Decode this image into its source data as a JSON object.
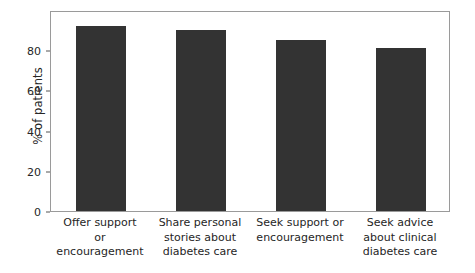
{
  "chart_data": {
    "type": "bar",
    "title": "",
    "subtitle": "",
    "xlabel": "",
    "ylabel": "% of patients",
    "categories": [
      "Offer support\nor\nencouragement",
      "Share personal\nstories about\ndiabetes care",
      "Seek support or\nencouragement",
      "Seek advice\nabout clinical\ndiabetes care"
    ],
    "values": [
      92,
      90,
      85,
      81
    ],
    "ylim": [
      0,
      100
    ],
    "yticks": [
      0,
      20,
      40,
      60,
      80
    ],
    "ytick_labels": [
      "0",
      "20",
      "40",
      "60",
      "80"
    ],
    "grid": false,
    "legend": null,
    "bar_color": "#333333",
    "frame_color": "#9a9a9a",
    "background": "#ffffff",
    "annotations": []
  }
}
